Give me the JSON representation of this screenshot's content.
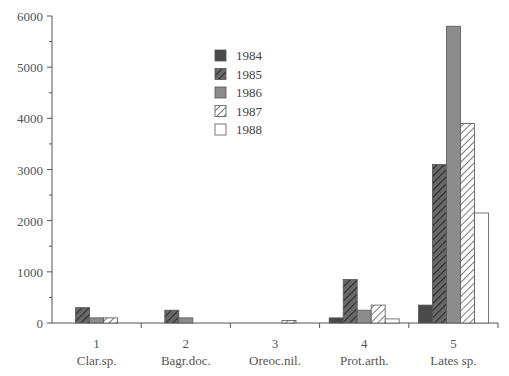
{
  "chart_data": {
    "type": "bar",
    "title": "",
    "xlabel": "",
    "ylabel": "",
    "ylim": [
      0,
      6000
    ],
    "yticks": [
      0,
      1000,
      2000,
      3000,
      4000,
      5000,
      6000
    ],
    "grid": false,
    "legend_position": "upper-center (inside plot)",
    "categories": [
      {
        "number": "1",
        "name": "Clar.sp."
      },
      {
        "number": "2",
        "name": "Bagr.doc."
      },
      {
        "number": "3",
        "name": "Oreoc.nil."
      },
      {
        "number": "4",
        "name": "Prot.arth."
      },
      {
        "number": "5",
        "name": "Lates sp."
      }
    ],
    "series": [
      {
        "name": "1984",
        "pattern": "solid-dark",
        "values": [
          0,
          0,
          0,
          100,
          350
        ]
      },
      {
        "name": "1985",
        "pattern": "hatched-dark",
        "values": [
          300,
          250,
          0,
          850,
          3100
        ]
      },
      {
        "name": "1986",
        "pattern": "solid-gray",
        "values": [
          100,
          100,
          0,
          250,
          5800
        ]
      },
      {
        "name": "1987",
        "pattern": "hatched-light",
        "values": [
          100,
          0,
          50,
          350,
          3900
        ]
      },
      {
        "name": "1988",
        "pattern": "white",
        "values": [
          0,
          0,
          0,
          80,
          2150
        ]
      }
    ]
  },
  "colors": {
    "axis": "#555555",
    "dark": "#4a4a4a",
    "gray": "#8c8c8c",
    "hatch_dark": "#3c3c3c",
    "hatch_light": "#666666",
    "white": "#ffffff"
  }
}
